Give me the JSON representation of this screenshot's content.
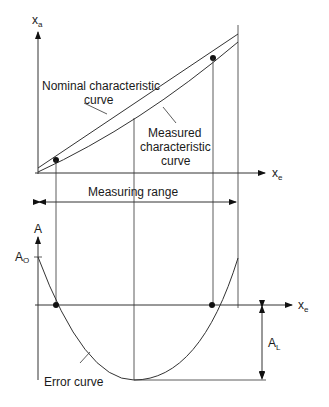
{
  "upper_chart": {
    "y_axis_label": "x",
    "y_axis_sub": "a",
    "x_axis_label": "x",
    "x_axis_sub": "e",
    "nominal_label_line1": "Nominal characteristic",
    "nominal_label_line2": "curve",
    "measured_label_line1": "Measured",
    "measured_label_line2": "characteristic",
    "measured_label_line3": "curve"
  },
  "measuring_range": {
    "label": "Measuring range"
  },
  "lower_chart": {
    "y_axis_label": "A",
    "offset_label": "A",
    "offset_sub": "O",
    "x_axis_label": "x",
    "x_axis_sub": "e",
    "linearity_label": "A",
    "linearity_sub": "L",
    "error_curve_label": "Error curve"
  },
  "colors": {
    "line": "#333333",
    "dot": "#111111",
    "background": "#ffffff"
  }
}
